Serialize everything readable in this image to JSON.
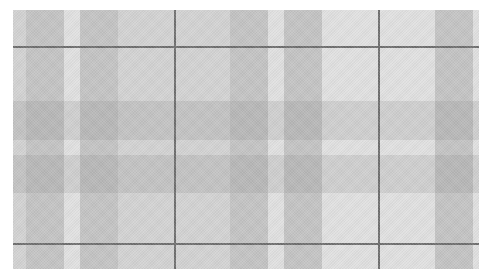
{
  "image": {
    "description": "Gray plaid / tartan fabric texture with dark thin grid lines",
    "colors": {
      "background": "#f3f3f3",
      "band": "#c4c4c4",
      "light_band": "#dcdcdc",
      "line": "#6e6e6e"
    },
    "vertical_bands": [
      {
        "x": 0,
        "w": 13,
        "tone": "light"
      },
      {
        "x": 13,
        "w": 38,
        "tone": "dark"
      },
      {
        "x": 67,
        "w": 38,
        "tone": "dark"
      },
      {
        "x": 105,
        "w": 112,
        "tone": "light"
      },
      {
        "x": 217,
        "w": 38,
        "tone": "dark"
      },
      {
        "x": 271,
        "w": 38,
        "tone": "dark"
      },
      {
        "x": 422,
        "w": 38,
        "tone": "dark"
      }
    ],
    "horizontal_bands": [
      {
        "y": 0,
        "w": 91,
        "tone": "light"
      },
      {
        "y": 91,
        "w": 39,
        "tone": "dark"
      },
      {
        "y": 145,
        "w": 38,
        "tone": "dark"
      },
      {
        "y": 130,
        "w": 15,
        "tone": "light"
      },
      {
        "y": 183,
        "w": 76,
        "tone": "light"
      }
    ],
    "horizontal_lines": [
      36,
      233
    ],
    "vertical_lines": [
      161,
      365
    ]
  }
}
